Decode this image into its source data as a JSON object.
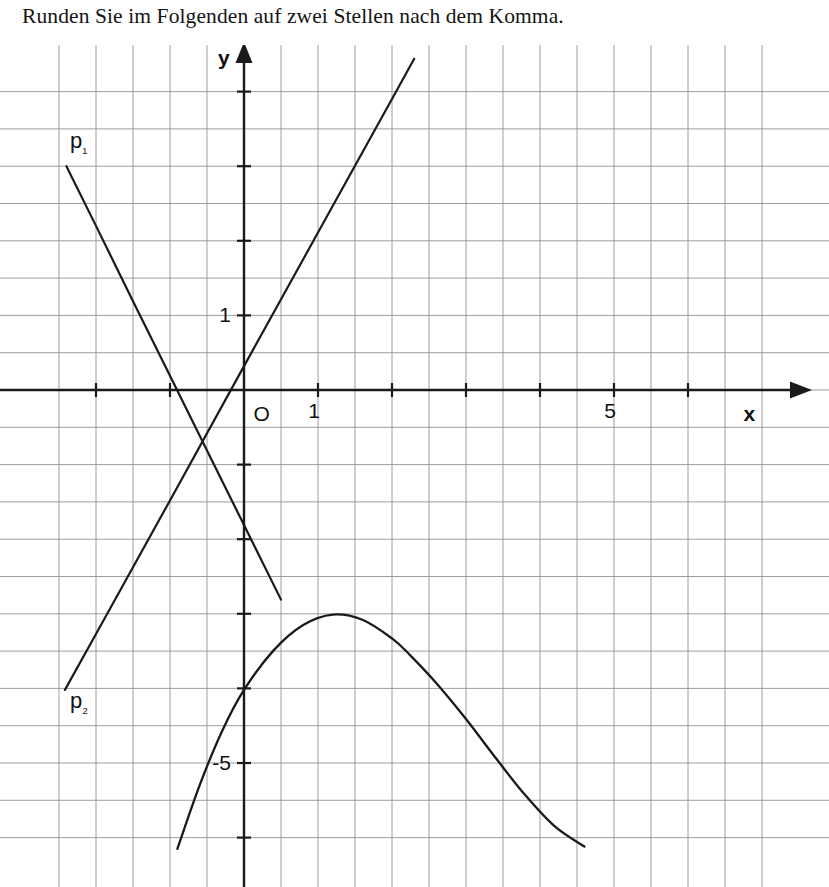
{
  "instruction": "Runden Sie im Folgenden auf zwei Stellen nach dem Komma.",
  "colors": {
    "grid": "#8c8c96",
    "axis": "#1a1a1a",
    "curve": "#1a1a1a",
    "background": "#ffffff",
    "text": "#111111"
  },
  "chart_data": {
    "type": "line",
    "title": "",
    "xlabel": "x",
    "ylabel": "y",
    "grid": true,
    "legend": "inline-labels",
    "xlim": [
      -2.92,
      7.0
    ],
    "ylim": [
      -6.1,
      4.47
    ],
    "origin_label": "O",
    "x_ticks": [
      {
        "value": -2,
        "label": ""
      },
      {
        "value": -1,
        "label": ""
      },
      {
        "value": 1,
        "label": "1"
      },
      {
        "value": 2,
        "label": ""
      },
      {
        "value": 3,
        "label": ""
      },
      {
        "value": 4,
        "label": ""
      },
      {
        "value": 5,
        "label": "5"
      },
      {
        "value": 6,
        "label": ""
      }
    ],
    "y_ticks": [
      {
        "value": 4,
        "label": ""
      },
      {
        "value": 3,
        "label": ""
      },
      {
        "value": 2,
        "label": ""
      },
      {
        "value": 1,
        "label": "1"
      },
      {
        "value": -1,
        "label": ""
      },
      {
        "value": -2,
        "label": ""
      },
      {
        "value": -3,
        "label": ""
      },
      {
        "value": -4,
        "label": ""
      },
      {
        "value": -5,
        "label": "-5"
      },
      {
        "value": -6,
        "label": ""
      }
    ],
    "minor_grid_step": 0.5,
    "series": [
      {
        "name": "p1",
        "label": "p₁",
        "kind": "descending-line",
        "label_at": [
          -2.35,
          3.25
        ],
        "points": [
          [
            -2.4,
            3.0
          ],
          [
            -2.0,
            2.2
          ],
          [
            -1.5,
            1.19
          ],
          [
            -1.0,
            0.19
          ],
          [
            -0.5,
            -0.81
          ],
          [
            0.0,
            -1.81
          ],
          [
            0.5,
            -2.81
          ]
        ]
      },
      {
        "name": "p2",
        "label": "p₂",
        "kind": "ascending-line",
        "label_at": [
          -2.35,
          -4.26
        ],
        "points": [
          [
            -2.42,
            -4.02
          ],
          [
            -2.0,
            -3.27
          ],
          [
            -1.0,
            -1.48
          ],
          [
            0.0,
            0.32
          ],
          [
            1.0,
            2.11
          ],
          [
            2.0,
            3.9
          ],
          [
            2.3,
            4.44
          ]
        ]
      },
      {
        "name": "f",
        "label": "",
        "kind": "cubic-curve",
        "points": [
          [
            -0.9,
            -6.15
          ],
          [
            -0.6,
            -5.3
          ],
          [
            -0.3,
            -4.58
          ],
          [
            0.0,
            -4.02
          ],
          [
            0.4,
            -3.49
          ],
          [
            0.8,
            -3.15
          ],
          [
            1.2,
            -3.01
          ],
          [
            1.6,
            -3.08
          ],
          [
            2.0,
            -3.33
          ],
          [
            2.24,
            -3.55
          ],
          [
            2.6,
            -3.93
          ],
          [
            3.0,
            -4.41
          ],
          [
            3.4,
            -4.93
          ],
          [
            3.8,
            -5.43
          ],
          [
            4.2,
            -5.85
          ],
          [
            4.6,
            -6.12
          ]
        ]
      }
    ],
    "annotations": [
      {
        "text": "y",
        "at": [
          -0.35,
          4.35
        ],
        "role": "y-axis-name"
      },
      {
        "text": "x",
        "at": [
          6.75,
          -0.42
        ],
        "role": "x-axis-name"
      },
      {
        "text": "O",
        "at": [
          0.13,
          -0.42
        ],
        "role": "origin"
      }
    ]
  }
}
